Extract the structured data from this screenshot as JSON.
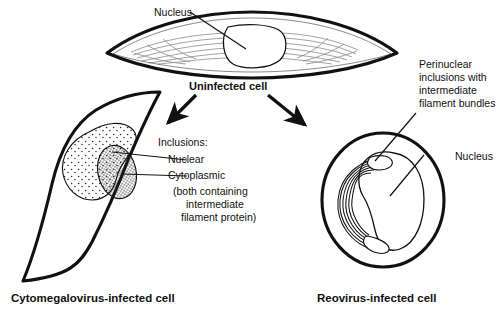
{
  "figure": {
    "title_semantic": "viral-inclusion-cell-morphology-diagram",
    "background": "#ffffff",
    "ink": "#111111",
    "filament_gray": "#8a8a8a"
  },
  "uninfected": {
    "caption": "Uninfected cell",
    "nucleus_label": "Nucleus"
  },
  "cmv": {
    "caption": "Cytomegalovirus-infected cell",
    "annotation": {
      "heading": "Inclusions:",
      "item_nuclear": "Nuclear",
      "item_cytoplasmic": "Cytoplasmic",
      "note_line1": "(both containing",
      "note_line2": "intermediate",
      "note_line3": "filament protein)"
    }
  },
  "reovirus": {
    "caption": "Reovirus-infected cell",
    "inclusion_label_line1": "Perinuclear",
    "inclusion_label_line2": "inclusions with",
    "inclusion_label_line3": "intermediate",
    "inclusion_label_line4": "filament bundles",
    "nucleus_label": "Nucleus"
  }
}
